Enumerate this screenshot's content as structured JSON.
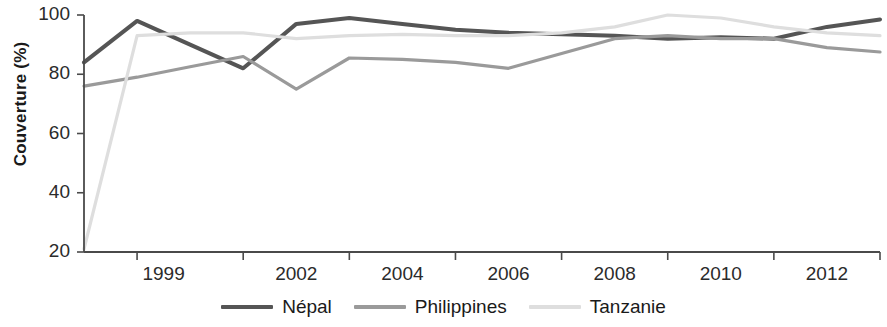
{
  "chart_data": {
    "type": "line",
    "title": "",
    "xlabel": "",
    "ylabel": "Couverture (%)",
    "ylim": [
      20,
      100
    ],
    "xlim": [
      1998,
      2013
    ],
    "grid": false,
    "legend_position": "bottom-center",
    "y_ticks": [
      100,
      80,
      60,
      40,
      20
    ],
    "y_tick_labels": [
      "100",
      "80",
      "60",
      "40",
      "20"
    ],
    "x_ticks": [
      1999,
      2001,
      2003,
      2005,
      2007,
      2009,
      2011,
      2013
    ],
    "x_tick_labels": [
      "1999",
      "2002",
      "2004",
      "2006",
      "2008",
      "2010",
      "2012"
    ],
    "x_label_years": [
      1999.5,
      2002,
      2004,
      2006,
      2008,
      2010,
      2012
    ],
    "x": [
      1998,
      1999,
      2000,
      2001,
      2002,
      2003,
      2004,
      2005,
      2006,
      2007,
      2008,
      2009,
      2010,
      2011,
      2012,
      2013
    ],
    "series": [
      {
        "name": "Népal",
        "color": "#555555",
        "width": 4,
        "values": [
          84,
          98,
          90,
          82,
          97,
          99,
          97,
          95,
          94,
          93.5,
          93,
          92,
          92.5,
          92,
          96,
          98.5
        ]
      },
      {
        "name": "Philippines",
        "color": "#9a9a9a",
        "width": 3.2,
        "values": [
          76,
          79,
          82.5,
          86,
          75,
          85.5,
          85,
          84,
          82,
          87,
          92,
          93,
          92,
          92,
          89,
          87.5
        ]
      },
      {
        "name": "Tanzanie",
        "color": "#dedede",
        "width": 3.2,
        "values": [
          21,
          93,
          94,
          94,
          92,
          93,
          93.5,
          93,
          93,
          94,
          96,
          100,
          99,
          96,
          94,
          93
        ]
      }
    ]
  },
  "legend": {
    "items": [
      {
        "label": "Népal",
        "swatch": "line-swatch-nepal"
      },
      {
        "label": "Philippines",
        "swatch": "line-swatch-philippines"
      },
      {
        "label": "Tanzanie",
        "swatch": "line-swatch-tanzanie"
      }
    ]
  },
  "axes": {
    "y_title": "Couverture (%)"
  }
}
